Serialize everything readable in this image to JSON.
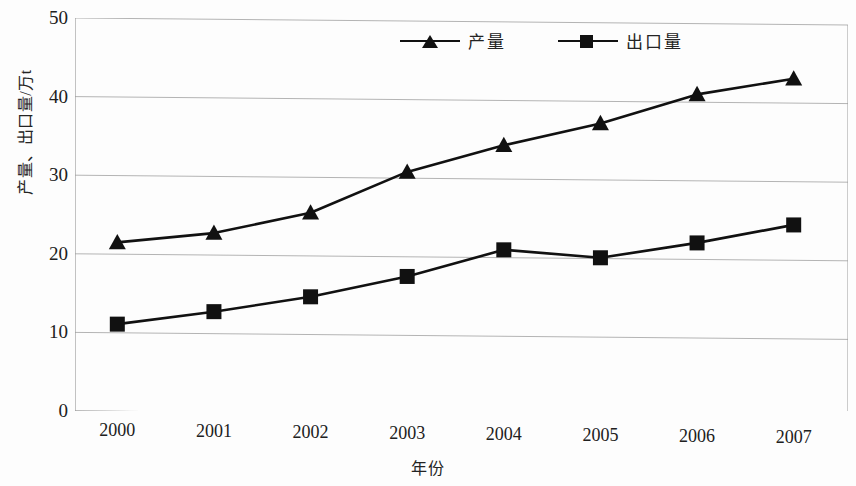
{
  "chart_data": {
    "type": "line",
    "title": "",
    "subtitle": "",
    "xlabel": "年份",
    "ylabel": "产量、出口量/万t",
    "categories": [
      "2000",
      "2001",
      "2002",
      "2003",
      "2004",
      "2005",
      "2006",
      "2007"
    ],
    "x": [
      2000,
      2001,
      2002,
      2003,
      2004,
      2005,
      2006,
      2007
    ],
    "series": [
      {
        "name": "产量",
        "marker": "triangle",
        "color": "#111111",
        "values": [
          21.5,
          22.8,
          25.5,
          30.8,
          34.3,
          37.2,
          41.0,
          43.1
        ]
      },
      {
        "name": "出口量",
        "marker": "square",
        "color": "#111111",
        "values": [
          11.1,
          12.8,
          14.8,
          17.5,
          21.0,
          20.1,
          22.1,
          24.5
        ]
      }
    ],
    "ylim": [
      0,
      50
    ],
    "yticks": [
      0,
      10,
      20,
      30,
      40,
      50
    ],
    "ytick_labels": [
      "0",
      "10",
      "20",
      "30",
      "40",
      "50"
    ],
    "grid": true,
    "grid_axis": "y",
    "grid_color": "#b4b4b4",
    "legend_position": "top-center",
    "frame_color": "#9a9a9a",
    "background": "#fdfdfd"
  },
  "legend": {
    "entries": [
      {
        "label": "产量",
        "marker": "triangle-marker-icon"
      },
      {
        "label": "出口量",
        "marker": "square-marker-icon"
      }
    ]
  },
  "axes": {
    "y_title": "产量、出口量/万t",
    "x_title": "年份"
  }
}
